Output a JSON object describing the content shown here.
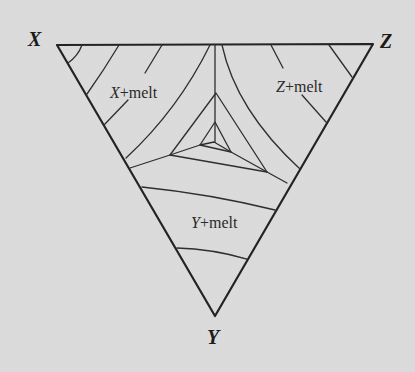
{
  "diagram": {
    "type": "ternary-phase-diagram",
    "vertices": [
      {
        "id": "X",
        "label": "X",
        "x": 57,
        "y": 45,
        "label_x": 28,
        "label_y": 46
      },
      {
        "id": "Z",
        "label": "Z",
        "x": 373,
        "y": 44,
        "label_x": 380,
        "label_y": 48
      },
      {
        "id": "Y",
        "label": "Y",
        "x": 215,
        "y": 316,
        "label_x": 207,
        "label_y": 344
      }
    ],
    "fields": [
      {
        "id": "x-melt",
        "component": "X",
        "suffix": "+melt",
        "x": 110,
        "y": 98
      },
      {
        "id": "z-melt",
        "component": "Z",
        "suffix": "+melt",
        "x": 276,
        "y": 92
      },
      {
        "id": "y-melt",
        "component": "Y",
        "suffix": "+melt",
        "x": 191,
        "y": 228
      }
    ],
    "colors": {
      "background": "#e3e3e3",
      "line": "#2e2e2e",
      "text": "#1c1c1c"
    }
  }
}
